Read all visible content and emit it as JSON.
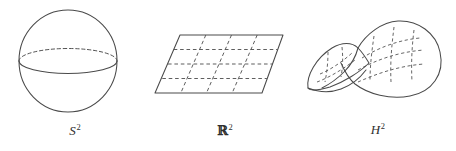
{
  "document": {
    "kind": "mathematical-figure",
    "description": "Three model geometries: sphere, plane, hyperbolic saddle",
    "background_color": "#ffffff",
    "stroke_color": "#4a4a4a",
    "dash_color": "#555555",
    "text_color": "#2e2e2e"
  },
  "figures": [
    {
      "id": "sphere",
      "name": "sphere-figure",
      "caption_base": "S",
      "caption_exponent": "2",
      "caption_full": "S²",
      "caption_style": "italic",
      "geometry": {
        "type": "circle-with-equator",
        "center_x": 68,
        "center_y": 61,
        "radius_x": 49,
        "radius_y": 51,
        "equator_y": 61,
        "equator_ry": 12.5,
        "equator_back_dashed": true,
        "equator_front_solid": true
      }
    },
    {
      "id": "plane",
      "name": "plane-figure",
      "caption_base": "R",
      "caption_exponent": "2",
      "caption_full": "ℝ²",
      "caption_style": "blackboard-bold",
      "geometry": {
        "type": "parallelogram-with-grid",
        "corners": [
          [
            30,
            35
          ],
          [
            133,
            35
          ],
          [
            112,
            93
          ],
          [
            5,
            93
          ]
        ],
        "grid_rows": 3,
        "grid_cols": 3,
        "grid_dashed": true
      }
    },
    {
      "id": "saddle",
      "name": "saddle-figure",
      "caption_base": "H",
      "caption_exponent": "2",
      "caption_full": "H²",
      "caption_style": "italic",
      "geometry": {
        "type": "hyperbolic-paraboloid",
        "left_lobe_peak": [
          35,
          42
        ],
        "right_lobe_peak": [
          96,
          22
        ],
        "saddle_dip": [
          70,
          55
        ],
        "grid_dashed": true,
        "grid_u_lines": 4,
        "grid_v_lines": 4
      }
    }
  ]
}
